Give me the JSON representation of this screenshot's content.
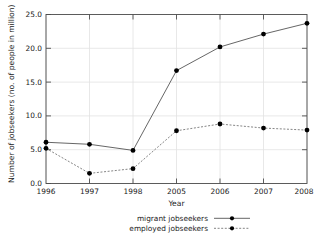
{
  "chart_data": {
    "type": "line",
    "title": "",
    "xlabel": "Year",
    "ylabel": "Number of jobseekers (no. of people in million)",
    "categories": [
      "1996",
      "1997",
      "1998",
      "2005",
      "2006",
      "2007",
      "2008"
    ],
    "x": [
      1996,
      1997,
      1998,
      2005,
      2006,
      2007,
      2008
    ],
    "series": [
      {
        "name": "migrant jobseekers",
        "style": "solid",
        "marker": "filled-circle",
        "color": "#555555",
        "values": [
          6.1,
          5.8,
          4.9,
          16.7,
          20.2,
          22.1,
          23.7
        ]
      },
      {
        "name": "employed jobseekers",
        "style": "dashed",
        "marker": "filled-circle",
        "color": "#777777",
        "values": [
          5.2,
          1.5,
          2.2,
          7.8,
          8.8,
          8.2,
          7.9
        ]
      }
    ],
    "ylim": [
      0.0,
      25.0
    ],
    "yticks": [
      "0.0",
      "5.0",
      "10.0",
      "15.0",
      "20.0",
      "25.0"
    ],
    "ytick_values": [
      0.0,
      5.0,
      10.0,
      15.0,
      20.0,
      25.0
    ],
    "xticks": [
      "1996",
      "1997",
      "1998",
      "2005",
      "2006",
      "2007",
      "2008"
    ],
    "grid": true,
    "legend_position": "bottom-center",
    "legend": [
      "migrant jobseekers",
      "employed jobseekers"
    ]
  },
  "colors": {
    "background": "#ffffff",
    "frame": "#4d4d4d",
    "grid": "#e2e2e2",
    "text": "#1a1a1a",
    "marker": "#000000"
  }
}
